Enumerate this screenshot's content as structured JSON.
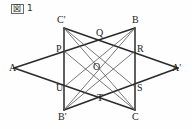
{
  "caption": {
    "mark": "図",
    "number": "1",
    "full": "図 1"
  },
  "figure": {
    "stroke_color": "#2a2a2a",
    "thin_stroke_color": "#555555",
    "background": "#fefefe",
    "width": 192,
    "height": 129
  },
  "points": [
    {
      "id": "A",
      "label": "A",
      "x": 14,
      "y": 68,
      "lx": 9,
      "ly": 63,
      "role": "outer-vertex"
    },
    {
      "id": "Ap",
      "label": "A'",
      "x": 178,
      "y": 68,
      "lx": 172,
      "ly": 63,
      "role": "outer-vertex"
    },
    {
      "id": "B",
      "label": "B",
      "x": 135,
      "y": 28,
      "lx": 132,
      "ly": 15,
      "role": "outer-vertex"
    },
    {
      "id": "Bp",
      "label": "B'",
      "x": 64,
      "y": 110,
      "lx": 58,
      "ly": 112,
      "role": "outer-vertex"
    },
    {
      "id": "C",
      "label": "C",
      "x": 135,
      "y": 110,
      "lx": 132,
      "ly": 112,
      "role": "outer-vertex"
    },
    {
      "id": "Cp",
      "label": "C'",
      "x": 64,
      "y": 28,
      "lx": 57,
      "ly": 15,
      "role": "outer-vertex"
    },
    {
      "id": "P",
      "label": "P",
      "x": 64,
      "y": 51,
      "lx": 56,
      "ly": 44,
      "role": "intersection"
    },
    {
      "id": "Q",
      "label": "Q",
      "x": 100,
      "y": 40,
      "lx": 96,
      "ly": 28,
      "role": "intersection"
    },
    {
      "id": "R",
      "label": "R",
      "x": 135,
      "y": 51,
      "lx": 137,
      "ly": 44,
      "role": "intersection"
    },
    {
      "id": "S",
      "label": "S",
      "x": 135,
      "y": 87,
      "lx": 137,
      "ly": 83,
      "role": "intersection"
    },
    {
      "id": "T",
      "label": "T",
      "x": 100,
      "y": 98,
      "lx": 97,
      "ly": 93,
      "role": "intersection"
    },
    {
      "id": "U",
      "label": "U",
      "x": 64,
      "y": 87,
      "lx": 56,
      "ly": 83,
      "role": "intersection"
    },
    {
      "id": "O",
      "label": "O",
      "x": 100,
      "y": 69,
      "lx": 93,
      "ly": 62,
      "role": "center"
    }
  ],
  "segments": [
    {
      "id": "seg-A-B",
      "from": "A",
      "to": "B",
      "weight": "thick"
    },
    {
      "id": "seg-A-C",
      "from": "A",
      "to": "C",
      "weight": "thick"
    },
    {
      "id": "seg-B-C",
      "from": "B",
      "to": "C",
      "weight": "thick"
    },
    {
      "id": "seg-Ap-Bp",
      "from": "Ap",
      "to": "Bp",
      "weight": "thick"
    },
    {
      "id": "seg-Ap-Cp",
      "from": "Ap",
      "to": "Cp",
      "weight": "thick"
    },
    {
      "id": "seg-Bp-Cp",
      "from": "Bp",
      "to": "Cp",
      "weight": "thick"
    },
    {
      "id": "seg-Cp-C",
      "from": "Cp",
      "to": "C",
      "weight": "thin"
    },
    {
      "id": "seg-B-Bp",
      "from": "B",
      "to": "Bp",
      "weight": "thin"
    },
    {
      "id": "seg-Cp-S",
      "from": "Cp",
      "to": "S",
      "weight": "thin"
    },
    {
      "id": "seg-B-U",
      "from": "B",
      "to": "U",
      "weight": "thin"
    },
    {
      "id": "seg-Bp-R",
      "from": "Bp",
      "to": "R",
      "weight": "thin"
    },
    {
      "id": "seg-C-P",
      "from": "C",
      "to": "P",
      "weight": "thin"
    }
  ]
}
